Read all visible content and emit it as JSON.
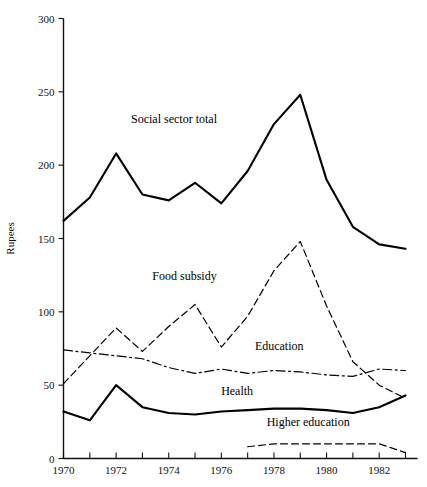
{
  "chart_data": {
    "type": "line",
    "title": "",
    "xlabel": "",
    "ylabel": "Rupees",
    "xlim": [
      1970,
      1983
    ],
    "ylim": [
      0,
      300
    ],
    "grid": false,
    "legend_position": "inline-annotations",
    "y_ticks": [
      0,
      50,
      100,
      150,
      200,
      250,
      300
    ],
    "y_tick_labels": [
      "0",
      "50",
      "100",
      "150",
      "200",
      "250",
      "300"
    ],
    "x_ticks": [
      1970,
      1971,
      1972,
      1973,
      1974,
      1975,
      1976,
      1977,
      1978,
      1979,
      1980,
      1981,
      1982,
      1983
    ],
    "x_tick_labels": [
      "1970",
      "",
      "1972",
      "",
      "1974",
      "",
      "1976",
      "",
      "1978",
      "",
      "1980",
      "",
      "1982",
      ""
    ],
    "x": [
      1970,
      1971,
      1972,
      1973,
      1974,
      1975,
      1976,
      1977,
      1978,
      1979,
      1980,
      1981,
      1982,
      1983
    ],
    "series": [
      {
        "name": "Social sector total",
        "style": "solid",
        "width": 2.1,
        "color": "#000000",
        "label_x": 1974.2,
        "label_y": 229,
        "values": [
          162,
          178,
          208,
          180,
          176,
          188,
          174,
          196,
          228,
          248,
          190,
          158,
          146,
          143
        ]
      },
      {
        "name": "Food subsidy",
        "style": "dashed",
        "width": 1.2,
        "color": "#000000",
        "label_x": 1974.6,
        "label_y": 122,
        "values": [
          51,
          70,
          89,
          73,
          90,
          105,
          76,
          97,
          128,
          148,
          104,
          66,
          50,
          41
        ]
      },
      {
        "name": "Education",
        "style": "dashdot",
        "width": 1.2,
        "color": "#000000",
        "label_x": 1978.2,
        "label_y": 74,
        "values": [
          74,
          72,
          70,
          68,
          62,
          58,
          61,
          58,
          60,
          59,
          57,
          56,
          61,
          60
        ]
      },
      {
        "name": "Health",
        "style": "solid",
        "width": 2.1,
        "color": "#000000",
        "label_x": 1976.6,
        "label_y": 43,
        "values": [
          32,
          26,
          50,
          35,
          31,
          30,
          32,
          33,
          34,
          34,
          33,
          31,
          35,
          43
        ]
      },
      {
        "name": "Higher education",
        "style": "dashed",
        "width": 1.2,
        "color": "#000000",
        "label_x": 1979.3,
        "label_y": 22,
        "start_year": 1977,
        "values": [
          null,
          null,
          null,
          null,
          null,
          null,
          null,
          8,
          10,
          10,
          10,
          10,
          10,
          4
        ]
      }
    ]
  },
  "axis": {
    "y_title": "Rupees"
  }
}
